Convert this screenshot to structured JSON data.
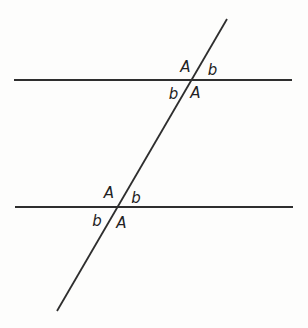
{
  "diagram": {
    "width": 308,
    "height": 328,
    "background_color": "#fdfdfc",
    "line_color": "#2e2e2e",
    "label_color": "#222222",
    "lines": [
      {
        "name": "top-parallel-line",
        "x1": 14,
        "y1": 80,
        "x2": 292,
        "y2": 80,
        "stroke_width": 2
      },
      {
        "name": "bottom-parallel-line",
        "x1": 15,
        "y1": 207,
        "x2": 293,
        "y2": 207,
        "stroke_width": 2
      },
      {
        "name": "transversal-line",
        "x1": 227,
        "y1": 19,
        "x2": 57,
        "y2": 311,
        "stroke_width": 1.8
      }
    ],
    "intersections": [
      {
        "name": "top-intersection",
        "x": 192,
        "y": 80
      },
      {
        "name": "bottom-intersection",
        "x": 118,
        "y": 207
      }
    ],
    "angle_labels": [
      {
        "name": "angle-A-top-intersection-upper-left",
        "text": "A",
        "x": 185.5,
        "y": 67
      },
      {
        "name": "angle-b-top-intersection-upper-right",
        "text": "b",
        "x": 212.5,
        "y": 70
      },
      {
        "name": "angle-b-top-intersection-lower-left",
        "text": "b",
        "x": 173.5,
        "y": 94
      },
      {
        "name": "angle-A-top-intersection-lower-right",
        "text": "A",
        "x": 195.5,
        "y": 93
      },
      {
        "name": "angle-A-bottom-intersection-upper-left",
        "text": "A",
        "x": 109,
        "y": 193
      },
      {
        "name": "angle-b-bottom-intersection-upper-right",
        "text": "b",
        "x": 136,
        "y": 197.5
      },
      {
        "name": "angle-b-bottom-intersection-lower-left",
        "text": "b",
        "x": 97,
        "y": 221
      },
      {
        "name": "angle-A-bottom-intersection-lower-right",
        "text": "A",
        "x": 121.5,
        "y": 222.5
      }
    ]
  }
}
